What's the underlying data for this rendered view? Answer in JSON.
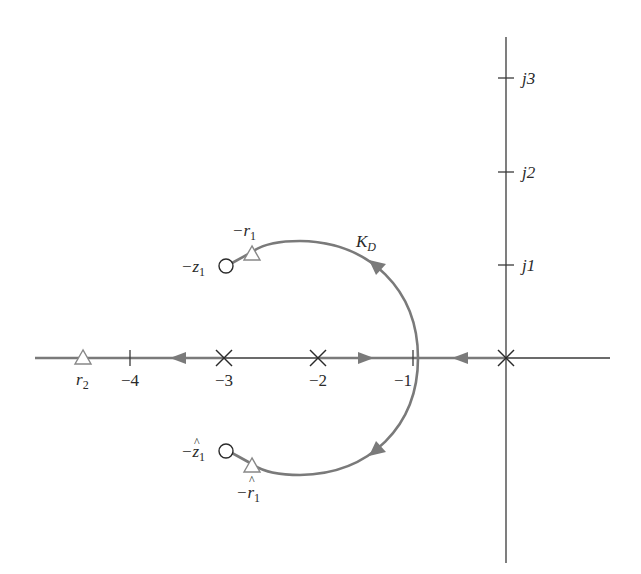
{
  "figure": {
    "type": "root-locus",
    "title": ""
  },
  "colors": {
    "axis": "#3a3a3a",
    "locus": "#7a7a7a",
    "marker_stroke": "#3a3a3a",
    "triangle_stroke": "#888888",
    "text": "#2a2a2a"
  },
  "axes": {
    "real_ticks": [
      {
        "value": -4,
        "label": "−4"
      },
      {
        "value": -3,
        "label": "−3"
      },
      {
        "value": -2,
        "label": "−2"
      },
      {
        "value": -1,
        "label": "−1"
      }
    ],
    "imag_ticks": [
      {
        "value": 1,
        "label": "j1"
      },
      {
        "value": 2,
        "label": "j2"
      },
      {
        "value": 3,
        "label": "j3"
      }
    ]
  },
  "poles": [
    {
      "re": 0,
      "im": 0,
      "marker": "x"
    },
    {
      "re": -2,
      "im": 0,
      "marker": "x"
    },
    {
      "re": -3,
      "im": 0,
      "marker": "x"
    }
  ],
  "zeros": [
    {
      "label_main": "−z",
      "label_sub": "1",
      "hat": false,
      "re": -3.0,
      "im": 0.99
    },
    {
      "label_main": "−z",
      "label_sub": "1",
      "hat": true,
      "re": -3.0,
      "im": -0.99
    }
  ],
  "closed_loop_roots": [
    {
      "label_main": "−r",
      "label_sub": "1",
      "hat": false,
      "marker": "triangle"
    },
    {
      "label_main": "−r",
      "label_sub": "1",
      "hat": true,
      "marker": "triangle"
    },
    {
      "label_main": "r",
      "label_sub": "2",
      "hat": false,
      "marker": "triangle"
    }
  ],
  "gain_label": {
    "main": "K",
    "sub": "D"
  },
  "labels": {
    "neg_r1_main": "−r",
    "neg_r1_sub": "1",
    "neg_z1_main": "−z",
    "neg_z1_sub": "1",
    "neg_z1hat_main": "−z",
    "neg_z1hat_sub": "1",
    "neg_r1hat_main": "−r",
    "neg_r1hat_sub": "1",
    "r2_main": "r",
    "r2_sub": "2",
    "kd_main": "K",
    "kd_sub": "D",
    "tick_m4": "−4",
    "tick_m3": "−3",
    "tick_m2": "−2",
    "tick_m1": "−1",
    "tick_j1": "j1",
    "tick_j2": "j2",
    "tick_j3": "j3",
    "hat": "^"
  }
}
